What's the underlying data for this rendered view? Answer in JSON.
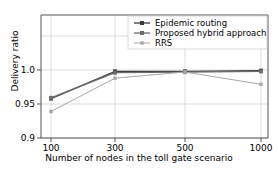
{
  "chart_data": {
    "type": "line",
    "title": "",
    "xlabel": "Number of nodes in the toll gate scenario",
    "ylabel": "Delivery ratio",
    "categories": [
      "100",
      "300",
      "500",
      "1000"
    ],
    "x_tick_labels": [
      "100",
      "300",
      "500",
      "1000"
    ],
    "y_tick_labels": [
      "0.9",
      "0.95",
      "1.0"
    ],
    "y_tick_values": [
      0.9,
      0.95,
      1.0
    ],
    "ylim": [
      0.9,
      1.012
    ],
    "grid": true,
    "legend_position": "upper right",
    "series": [
      {
        "name": "Epidemic routing",
        "values": [
          0.958,
          0.998,
          0.998,
          0.999
        ],
        "color": "#3a3a3a",
        "marker": "square"
      },
      {
        "name": "Proposed hybrid approach",
        "values": [
          0.959,
          0.996,
          0.997,
          0.998
        ],
        "color": "#6b6b6b",
        "marker": "square"
      },
      {
        "name": "RRS",
        "values": [
          0.939,
          0.988,
          0.997,
          0.979
        ],
        "color": "#a8a8a8",
        "marker": "square"
      }
    ]
  },
  "axes": {
    "y_ticks": [
      {
        "label": "0.9"
      },
      {
        "label": "0.95"
      },
      {
        "label": "1.0"
      }
    ],
    "x_ticks": [
      {
        "label": "100"
      },
      {
        "label": "300"
      },
      {
        "label": "500"
      },
      {
        "label": "1000"
      }
    ]
  },
  "legend": {
    "entries": [
      {
        "label": "Epidemic routing"
      },
      {
        "label": "Proposed hybrid approach"
      },
      {
        "label": "RRS"
      }
    ]
  },
  "colors": {
    "series_1": "#3a3a3a",
    "series_2": "#6b6b6b",
    "series_3": "#a8a8a8",
    "grid": "#d4d4d4",
    "spine": "#555555",
    "background": "#ffffff"
  }
}
